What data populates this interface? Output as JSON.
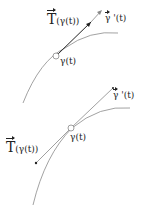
{
  "figure": {
    "top": {
      "field_label_main": "T",
      "field_label_arg": "(γ(t))",
      "velocity_label_main": "γ",
      "velocity_label_suffix": " '(t)",
      "point_label": "γ(t)"
    },
    "bottom": {
      "field_label_main": "T",
      "field_label_arg": "(γ(t))",
      "velocity_label_main": "γ",
      "velocity_label_suffix": " '(t)",
      "point_label": "γ(t)"
    },
    "colors": {
      "curve": "#8a8a8a",
      "vector": "#222222",
      "text": "#222222"
    }
  }
}
